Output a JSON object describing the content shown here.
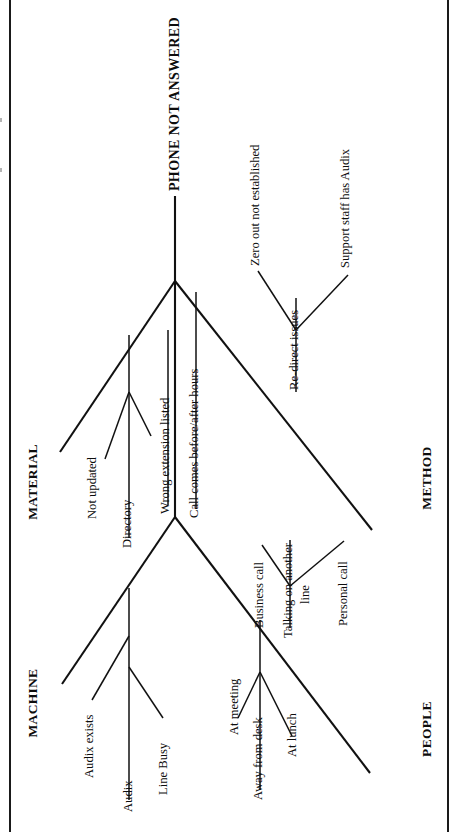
{
  "diagram": {
    "type": "fishbone",
    "orientation": "rotated-90-ccw",
    "effect": "PHONE NOT ANSWERED",
    "categories": [
      {
        "name": "MACHINE",
        "side": "upper-left",
        "causes": [
          {
            "label": "Audix"
          },
          {
            "label": "Audix exists"
          },
          {
            "label": "Line Busy"
          }
        ]
      },
      {
        "name": "MATERIAL",
        "side": "upper-left",
        "causes": [
          {
            "label": "Directory"
          },
          {
            "label": "Not updated"
          },
          {
            "label": "Wrong extension listed"
          }
        ]
      },
      {
        "name": "PEOPLE",
        "side": "lower-right",
        "causes": [
          {
            "label": "Away from desk"
          },
          {
            "label": "At lunch"
          },
          {
            "label": "At meeting"
          },
          {
            "label": "Business call"
          },
          {
            "label": "Talking on another"
          },
          {
            "label": "line"
          },
          {
            "label": "Personal call"
          }
        ]
      },
      {
        "name": "METHOD",
        "side": "lower-right",
        "causes": [
          {
            "label": "Call comes before/after hours"
          },
          {
            "label": "Zero out not established"
          },
          {
            "label": "Re-direct issues"
          },
          {
            "label": "Support staff has Audix"
          }
        ]
      }
    ],
    "labels": {
      "head": "PHONE NOT ANSWERED",
      "machine": "MACHINE",
      "material": "MATERIAL",
      "people": "PEOPLE",
      "method": "METHOD",
      "audix": "Audix",
      "audix_exists": "Audix exists",
      "line_busy": "Line Busy",
      "directory": "Directory",
      "not_updated": "Not updated",
      "wrong_extension": "Wrong extension listed",
      "call_comes": "Call comes before/after hours",
      "away_from_desk": "Away from desk",
      "at_lunch": "At lunch",
      "at_meeting": "At meeting",
      "business_call": "Business call",
      "talking_line_1": "Talking on another",
      "talking_line_2": "line",
      "personal_call": "Personal call",
      "zero_out": "Zero out not established",
      "redirect": "Re-direct issues",
      "support_staff": "Support staff has Audix"
    },
    "colors": {
      "ink": "#111111",
      "page": "#ffffff",
      "frame": "#1a1a1a"
    }
  }
}
